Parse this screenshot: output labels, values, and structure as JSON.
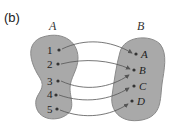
{
  "panel_label": "(b)",
  "set_a": {
    "label": "A",
    "elements": [
      "1",
      "2",
      "3",
      "4",
      "5"
    ]
  },
  "set_b": {
    "label": "B",
    "elements": [
      "A",
      "B",
      "C",
      "D"
    ]
  },
  "mappings": [
    {
      "from": "1",
      "to": "A"
    },
    {
      "from": "2",
      "to": "B"
    },
    {
      "from": "3",
      "to": "B"
    },
    {
      "from": "4",
      "to": "C"
    },
    {
      "from": "5",
      "to": "D"
    }
  ],
  "colors": {
    "blob_fill": "#a9a9a9",
    "blob_stroke": "#8a8a8a",
    "arrow": "#555555",
    "dot": "#333333"
  }
}
